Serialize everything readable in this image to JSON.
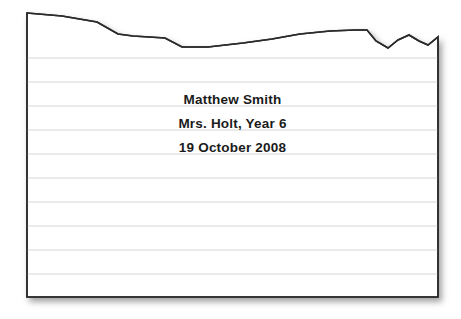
{
  "document": {
    "kind": "ruled-paper-sheet",
    "page_color": "#ffffff",
    "border_color": "#2b2b2b",
    "rule_color": "#e2e2e2",
    "shadow_color": "#b4b4b4",
    "text_color": "#1b1b1b",
    "torn_top_edge": true,
    "rule_count": 10,
    "body_lines": [
      {
        "id": "student-name",
        "text": "Matthew Smith"
      },
      {
        "id": "teacher-class",
        "text": "Mrs. Holt, Year 6"
      },
      {
        "id": "date",
        "text": "19 October 2008"
      }
    ],
    "geometry": {
      "left": 27,
      "right": 438,
      "bottom": 297,
      "rule_start_y": 58,
      "rule_spacing": 24,
      "torn_edge_points": "27,13 62,16 97,22 118,34 133,36 165,38 182,47 208,47 243,43 272,39 300,34 330,31 355,30 367,30 376,41 388,48 398,40 409,35 419,41 428,45 438,37 438,42"
    }
  }
}
